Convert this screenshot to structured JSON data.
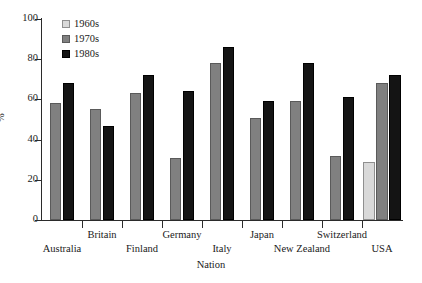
{
  "chart_data": {
    "type": "bar",
    "title": "",
    "xlabel": "Nation",
    "ylabel": "%",
    "ylim": [
      0,
      100
    ],
    "yticks": [
      0,
      20,
      40,
      60,
      80,
      100
    ],
    "grid": false,
    "legend_position": "top-left",
    "categories": [
      "Australia",
      "Britain",
      "Finland",
      "Germany",
      "Italy",
      "Japan",
      "New Zealand",
      "Switzerland",
      "USA"
    ],
    "series": [
      {
        "name": "1960s",
        "color": "#d9d9d9",
        "values": [
          null,
          null,
          null,
          null,
          null,
          null,
          null,
          null,
          29
        ]
      },
      {
        "name": "1970s",
        "color": "#808080",
        "values": [
          58,
          55,
          63,
          31,
          78,
          51,
          59,
          32,
          68
        ]
      },
      {
        "name": "1980s",
        "color": "#141414",
        "values": [
          68,
          47,
          72,
          64,
          86,
          59,
          78,
          61,
          72
        ]
      }
    ]
  },
  "legend": {
    "items": [
      {
        "label": "1960s",
        "swatch": "legend-swatch-1960s"
      },
      {
        "label": "1970s",
        "swatch": "legend-swatch-1970s"
      },
      {
        "label": "1980s",
        "swatch": "legend-swatch-1980s"
      }
    ]
  },
  "axes": {
    "y_title": "%",
    "x_title": "Nation",
    "y_tick_labels": [
      "100",
      "80",
      "60",
      "40",
      "20",
      "0"
    ]
  }
}
